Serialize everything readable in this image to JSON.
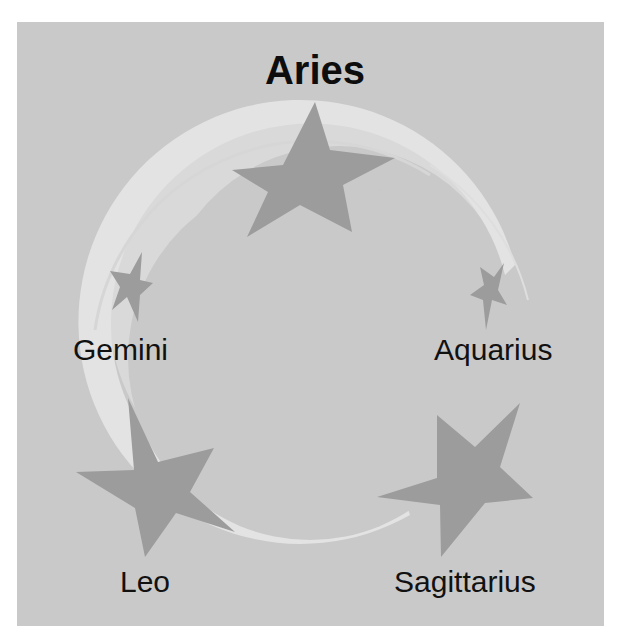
{
  "diagram": {
    "title": "Aries",
    "labels": {
      "gemini": "Gemini",
      "aquarius": "Aquarius",
      "leo": "Leo",
      "sagittarius": "Sagittarius"
    },
    "colors": {
      "background": "#c9c9c9",
      "ring": "#e2e2e2",
      "star": "#9c9c9c",
      "text": "#111111"
    },
    "icons": [
      "star-icon",
      "ring-swoosh"
    ]
  }
}
